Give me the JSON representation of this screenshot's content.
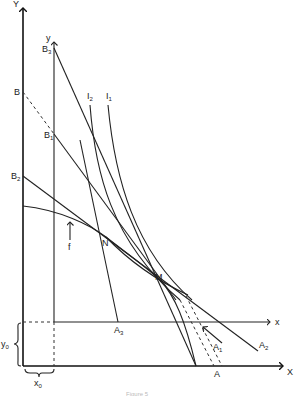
{
  "diagram": {
    "outer_axes": {
      "y_label": "Y",
      "x_label": "X"
    },
    "inner_axes": {
      "y_label": "y",
      "x_label": "x"
    },
    "points": {
      "B": {
        "label": "B",
        "sub": ""
      },
      "B1": {
        "label": "B",
        "sub": "1"
      },
      "B2": {
        "label": "B",
        "sub": "2"
      },
      "B3": {
        "label": "B",
        "sub": "3"
      },
      "A": {
        "label": "A",
        "sub": ""
      },
      "A1": {
        "label": "A",
        "sub": "1"
      },
      "A2": {
        "label": "A",
        "sub": "2"
      },
      "A3": {
        "label": "A",
        "sub": "3"
      },
      "N": {
        "label": "N"
      },
      "M": {
        "label": "M"
      }
    },
    "curves": {
      "I1": {
        "label": "I",
        "sub": "1"
      },
      "I2": {
        "label": "I",
        "sub": "2"
      },
      "f": {
        "label": "f"
      }
    },
    "offsets": {
      "y0": {
        "label": "y",
        "sub": "0"
      },
      "x0": {
        "label": "x",
        "sub": "0"
      }
    },
    "caption": "Figure 5"
  }
}
